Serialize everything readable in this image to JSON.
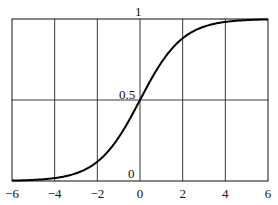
{
  "chart_data": {
    "type": "line",
    "title": "",
    "xlabel": "",
    "ylabel": "",
    "xlim": [
      -6,
      6
    ],
    "ylim": [
      0,
      1
    ],
    "grid": true,
    "x_ticks": [
      "−6",
      "−4",
      "−2",
      "0",
      "2",
      "4",
      "6"
    ],
    "y_tick_labels": [
      "0",
      "0.5",
      "1"
    ],
    "series": [
      {
        "name": "sigmoid",
        "x": [
          -6,
          -5,
          -4,
          -3,
          -2,
          -1,
          0,
          1,
          2,
          3,
          4,
          5,
          6
        ],
        "values": [
          0.0025,
          0.0067,
          0.018,
          0.047,
          0.119,
          0.269,
          0.5,
          0.731,
          0.881,
          0.953,
          0.982,
          0.993,
          0.9975
        ]
      }
    ]
  },
  "labels": {
    "y_top": "1",
    "y_mid": "0.5",
    "y_bottom": "0",
    "x": [
      "−6",
      "−4",
      "−2",
      "0",
      "2",
      "4",
      "6"
    ]
  }
}
